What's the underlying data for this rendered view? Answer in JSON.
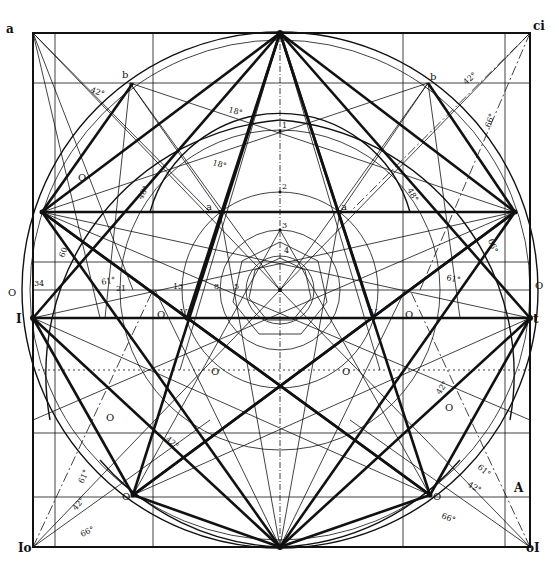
{
  "diagram": {
    "ink_color": "#111111",
    "background": "#ffffff",
    "corner_labels": {
      "top_left": "a",
      "top_right": "ci",
      "bottom_left": "Io",
      "bottom_right": "oI"
    },
    "side_labels": {
      "left_mid_upper": "O",
      "left_mid_lower": "I",
      "right_mid_upper": "O",
      "right_mid_lower": "t",
      "left_row_number": "34"
    },
    "point_labels": {
      "b_left": "b",
      "b_right": "b",
      "a_left": "a",
      "a_right": "a",
      "v_left": "V",
      "v_right": "V",
      "o_left_inner": "O",
      "o_right_inner": "O",
      "o_left_low": "O",
      "o_right_low": "O",
      "o_left_mid": "O",
      "o_right_mid": "O",
      "o_left_arc": "O",
      "o_bottom_left": "O",
      "o_bottom_right": "O",
      "A": "A"
    },
    "axis_numbers": [
      "1",
      "2",
      "3",
      "4"
    ],
    "row_numbers": [
      "21",
      "13",
      "8",
      "5"
    ],
    "angle_labels": {
      "top_left_42": "42°",
      "top_right_42": "42°",
      "top_right_66": "66°",
      "upper_18_a": "18°",
      "upper_18_b": "18°",
      "left_48": "48°",
      "right_48": "48°",
      "left_60": "60",
      "right_66": "66°",
      "left_61": "61°",
      "right_61": "61°",
      "lower_left_42": "42°",
      "lower_right_42": "42°",
      "bl_61": "61°",
      "bl_42": "42°",
      "bl_66": "66°",
      "br_61": "61°",
      "br_42": "42°",
      "br_66": "66°"
    }
  }
}
